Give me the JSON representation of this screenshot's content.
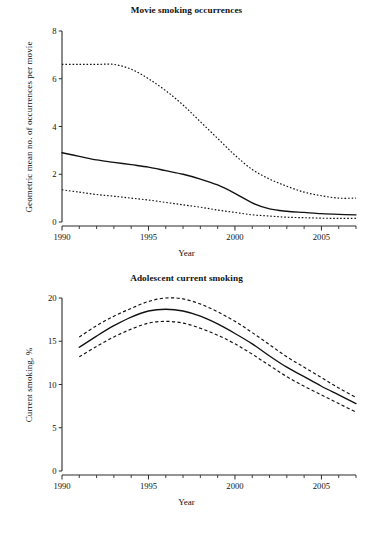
{
  "figure": {
    "xlabel": "Year"
  },
  "chart_data": [
    {
      "type": "line",
      "title": "Movie smoking occurrences",
      "xlabel": "Year",
      "ylabel": "Geometric mean no. of occurrences per movie",
      "xlim": [
        1990,
        2007
      ],
      "ylim": [
        0,
        8
      ],
      "xticks": [
        1990,
        1995,
        2000,
        2005
      ],
      "xtick_labels": [
        "1990",
        "1995",
        "2000",
        "2005"
      ],
      "xminor_step": 1,
      "yticks": [
        0,
        2,
        4,
        6,
        8
      ],
      "ytick_labels": [
        "0",
        "2",
        "4",
        "6",
        "8"
      ],
      "grid": false,
      "legend": "none",
      "x": [
        1990,
        1991,
        1992,
        1993,
        1994,
        1995,
        1996,
        1997,
        1998,
        1999,
        2000,
        2001,
        2002,
        2003,
        2004,
        2005,
        2006,
        2007
      ],
      "series": [
        {
          "name": "Upper 95% CI",
          "style": "dotted",
          "values": [
            6.6,
            6.6,
            6.6,
            6.6,
            6.4,
            6.0,
            5.5,
            4.9,
            4.2,
            3.5,
            2.8,
            2.2,
            1.8,
            1.5,
            1.25,
            1.1,
            1.0,
            1.0
          ]
        },
        {
          "name": "Geometric mean",
          "style": "solid",
          "values": [
            2.9,
            2.75,
            2.6,
            2.5,
            2.4,
            2.3,
            2.15,
            2.0,
            1.8,
            1.55,
            1.2,
            0.8,
            0.55,
            0.45,
            0.4,
            0.35,
            0.32,
            0.3
          ]
        },
        {
          "name": "Lower 95% CI",
          "style": "dotted",
          "values": [
            1.35,
            1.25,
            1.15,
            1.08,
            1.0,
            0.92,
            0.82,
            0.72,
            0.62,
            0.5,
            0.4,
            0.3,
            0.25,
            0.2,
            0.18,
            0.16,
            0.15,
            0.15
          ]
        }
      ]
    },
    {
      "type": "line",
      "title": "Adolescent current smoking",
      "xlabel": "Year",
      "ylabel": "Current smoking, %",
      "xlim": [
        1990,
        2007
      ],
      "ylim": [
        0,
        20
      ],
      "xticks": [
        1990,
        1995,
        2000,
        2005
      ],
      "xtick_labels": [
        "1990",
        "1995",
        "2000",
        "2005"
      ],
      "xminor_step": 1,
      "yticks": [
        0,
        5,
        10,
        15,
        20
      ],
      "ytick_labels": [
        "0",
        "5",
        "10",
        "15",
        "20"
      ],
      "grid": false,
      "legend": "none",
      "x": [
        1991,
        1992,
        1993,
        1994,
        1995,
        1996,
        1997,
        1998,
        1999,
        2000,
        2001,
        2002,
        2003,
        2004,
        2005,
        2006,
        2007
      ],
      "series": [
        {
          "name": "Upper 95% CI",
          "style": "dashed",
          "values": [
            15.5,
            16.8,
            17.9,
            18.8,
            19.6,
            20.0,
            19.9,
            19.3,
            18.4,
            17.3,
            16.0,
            14.6,
            13.2,
            12.0,
            10.8,
            9.6,
            8.5
          ]
        },
        {
          "name": "Prevalence",
          "style": "solid",
          "values": [
            14.3,
            15.6,
            16.8,
            17.8,
            18.5,
            18.7,
            18.5,
            17.9,
            17.0,
            15.9,
            14.7,
            13.3,
            12.0,
            10.9,
            9.8,
            8.8,
            7.8
          ]
        },
        {
          "name": "Lower 95% CI",
          "style": "dashed",
          "values": [
            13.2,
            14.4,
            15.5,
            16.4,
            17.1,
            17.3,
            17.1,
            16.5,
            15.7,
            14.7,
            13.5,
            12.2,
            10.9,
            9.8,
            8.8,
            7.8,
            6.8
          ]
        }
      ]
    }
  ]
}
